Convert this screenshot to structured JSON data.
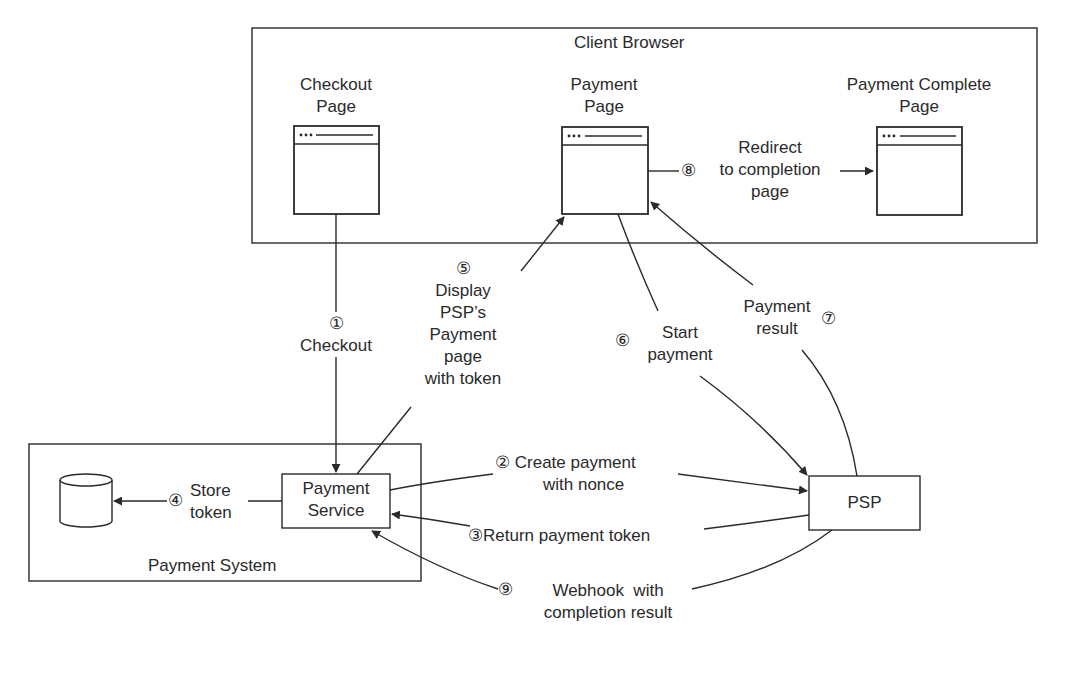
{
  "diagram": {
    "colors": {
      "stroke": "#2a2a2a",
      "background": "#ffffff"
    },
    "groups": {
      "client_browser": {
        "title": "Client Browser"
      },
      "payment_system": {
        "title": "Payment System"
      }
    },
    "nodes": {
      "checkout_page": {
        "line1": "Checkout",
        "line2": "Page",
        "icon": "browser-window-icon"
      },
      "payment_page": {
        "line1": "Payment",
        "line2": "Page",
        "icon": "browser-window-icon"
      },
      "payment_complete_page": {
        "line1": "Payment Complete",
        "line2": "Page",
        "icon": "browser-window-icon"
      },
      "payment_service": {
        "line1": "Payment",
        "line2": "Service"
      },
      "database": {
        "icon": "database-icon"
      },
      "psp": {
        "label": "PSP"
      }
    },
    "steps": [
      {
        "num": "①",
        "line1": "Checkout"
      },
      {
        "num": "②",
        "line1": "Create payment",
        "line2": "with nonce"
      },
      {
        "num": "③",
        "line1": "Return payment token"
      },
      {
        "num": "④",
        "line1": "Store",
        "line2": "token"
      },
      {
        "num": "⑤",
        "line1": "Display",
        "line2": "PSP’s",
        "line3": "Payment",
        "line4": "page",
        "line5": "with token"
      },
      {
        "num": "⑥",
        "line1": "Start",
        "line2": "payment"
      },
      {
        "num": "⑦",
        "line1": "Payment",
        "line2": "result"
      },
      {
        "num": "⑧",
        "line1": "Redirect",
        "line2": "to completion",
        "line3": "page"
      },
      {
        "num": "⑨",
        "line1": "Webhook  with",
        "line2": "completion result"
      }
    ]
  }
}
